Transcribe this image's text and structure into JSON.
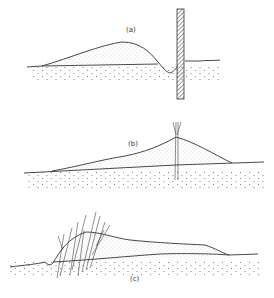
{
  "figure": {
    "panels": [
      {
        "id": "a",
        "label": "(a)",
        "description": "Dune with fence driven into ground; scour hollow forms on windward side of fence"
      },
      {
        "id": "b",
        "label": "(b)",
        "description": "Dune built up around a brushwood fence embedded within the sand"
      },
      {
        "id": "c",
        "label": "(c)",
        "description": "Dune stabilized by planted grass/vegetation on its front slope"
      }
    ],
    "colors": {
      "ink": "#333333",
      "background": "#ffffff",
      "stipple": "#555555"
    }
  }
}
